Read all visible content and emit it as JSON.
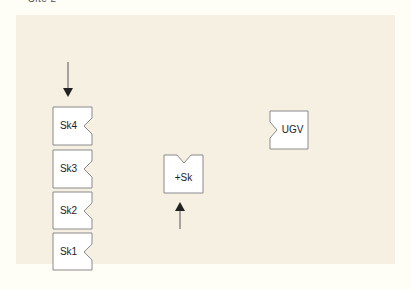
{
  "caption": "Site 2",
  "colors": {
    "page_background": "#fefdf6",
    "panel_background": "#f5f0e1",
    "box_fill": "#ffffff",
    "box_stroke": "#8a8a8a",
    "arrow": "#333333"
  },
  "nodes": [
    {
      "id": "sk4",
      "label": "Sk4",
      "notch": "right"
    },
    {
      "id": "sk3",
      "label": "Sk3",
      "notch": "right"
    },
    {
      "id": "sk2",
      "label": "Sk2",
      "notch": "right"
    },
    {
      "id": "sk1",
      "label": "Sk1",
      "notch": "right"
    },
    {
      "id": "plus-sk",
      "label": "+Sk",
      "notch": "top"
    },
    {
      "id": "ugv",
      "label": "UGV",
      "notch": "left"
    }
  ],
  "arrows": [
    {
      "id": "arrow-into-stack",
      "direction": "down",
      "target": "Sk4"
    },
    {
      "id": "arrow-into-plus-sk",
      "direction": "up",
      "target": "+Sk"
    }
  ]
}
